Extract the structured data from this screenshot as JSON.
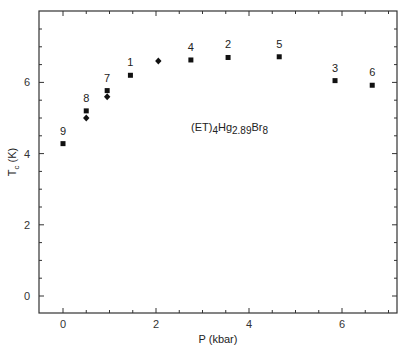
{
  "chart_data": {
    "type": "scatter",
    "title": "",
    "xlabel": "P (kbar)",
    "ylabel": "T_c (K)",
    "xlim": [
      -0.5,
      7.1
    ],
    "ylim": [
      -0.5,
      7.9
    ],
    "xticks": [
      0,
      2,
      4,
      6
    ],
    "yticks": [
      0,
      2,
      4,
      6
    ],
    "grid": false,
    "annotation": {
      "text_parts": [
        {
          "t": "(ET)",
          "s": "normal"
        },
        {
          "t": "4",
          "s": "sub"
        },
        {
          "t": "Hg",
          "s": "normal"
        },
        {
          "t": "2.89",
          "s": "sub"
        },
        {
          "t": "Br",
          "s": "normal"
        },
        {
          "t": "8",
          "s": "sub"
        }
      ],
      "x": 2.3,
      "y": 4.5
    },
    "series": [
      {
        "name": "squares",
        "marker": "square",
        "points": [
          {
            "label": "9",
            "x": 0.0,
            "y": 4.28
          },
          {
            "label": "8",
            "x": 0.5,
            "y": 5.2
          },
          {
            "label": "7",
            "x": 0.95,
            "y": 5.77
          },
          {
            "label": "1",
            "x": 1.45,
            "y": 6.2
          },
          {
            "label": "4",
            "x": 2.75,
            "y": 6.63
          },
          {
            "label": "2",
            "x": 3.55,
            "y": 6.7
          },
          {
            "label": "5",
            "x": 4.65,
            "y": 6.72
          },
          {
            "label": "3",
            "x": 5.85,
            "y": 6.05
          },
          {
            "label": "6",
            "x": 6.65,
            "y": 5.92
          }
        ]
      },
      {
        "name": "diamonds",
        "marker": "diamond",
        "points": [
          {
            "label": "",
            "x": 0.5,
            "y": 5.0
          },
          {
            "label": "",
            "x": 0.95,
            "y": 5.6
          },
          {
            "label": "",
            "x": 2.05,
            "y": 6.6
          }
        ]
      }
    ]
  },
  "axes": {
    "x_label": "P (kbar)",
    "y_label_main": "T",
    "y_label_sub": "c",
    "y_label_unit": " (K)"
  }
}
